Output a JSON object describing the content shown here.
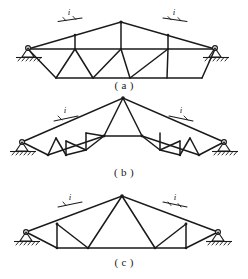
{
  "figure": {
    "kind": "engineering-line-drawing",
    "background_color": "#ffffff",
    "line_color": "#1a1a1a",
    "width": 248,
    "height": 279
  },
  "panels": [
    {
      "id": "a",
      "caption": "( a )",
      "truss_type": "trapezoidal-polonceau-with-flat-bottom-chord",
      "slope_labels": [
        "i",
        "i"
      ],
      "support_left": "pin-support",
      "support_right": "roller-support",
      "geometry": {
        "span_px": 200,
        "left_bearing": [
          28,
          49
        ],
        "right_bearing": [
          215,
          49
        ],
        "apex": [
          121,
          22
        ],
        "top_chord_nodes": [
          [
            28,
            49
          ],
          [
            75,
            35
          ],
          [
            121,
            22
          ],
          [
            168,
            35
          ],
          [
            215,
            49
          ]
        ],
        "mid_chord_nodes": [
          [
            28,
            49
          ],
          [
            75,
            49
          ],
          [
            121,
            49
          ],
          [
            168,
            49
          ],
          [
            215,
            49
          ]
        ],
        "bottom_chord_nodes": [
          [
            56,
            78
          ],
          [
            202,
            78
          ]
        ],
        "bottom_chord_interior": [
          [
            56,
            78
          ],
          [
            93,
            78
          ],
          [
            130,
            78
          ],
          [
            167,
            78
          ],
          [
            202,
            78
          ]
        ],
        "verticals": [
          [
            75,
            35,
            75,
            49
          ],
          [
            121,
            22,
            121,
            49
          ],
          [
            168,
            35,
            168,
            49
          ]
        ],
        "diagonals": [
          [
            28,
            49,
            56,
            78
          ],
          [
            56,
            78,
            75,
            49
          ],
          [
            75,
            49,
            93,
            78
          ],
          [
            93,
            78,
            121,
            49
          ],
          [
            121,
            49,
            130,
            78
          ],
          [
            130,
            78,
            168,
            49
          ],
          [
            168,
            49,
            167,
            78
          ],
          [
            167,
            78,
            202,
            78
          ],
          [
            202,
            78,
            215,
            49
          ]
        ]
      }
    },
    {
      "id": "b",
      "caption": "( b )",
      "truss_type": "steep-pitched-parallel-chord-gable-truss",
      "slope_labels": [
        "i",
        "i"
      ],
      "support_left": "pin-support",
      "support_right": "roller-support",
      "geometry": {
        "span_px": 200,
        "left_bearing": [
          22,
          142
        ],
        "right_bearing": [
          224,
          142
        ],
        "apex": [
          123,
          98
        ],
        "top_chord_nodes": [
          [
            22,
            142
          ],
          [
            123,
            98
          ],
          [
            224,
            142
          ]
        ],
        "bottom_chord_nodes": [
          [
            48,
            155
          ],
          [
            199,
            155
          ]
        ],
        "ridge_box": [
          [
            104,
            136
          ],
          [
            142,
            136
          ]
        ]
      }
    },
    {
      "id": "c",
      "caption": "( c )",
      "truss_type": "triangular-fink-truss-with-flat-bottom-chord",
      "slope_labels": [
        "i",
        "i"
      ],
      "support_left": "pin-support",
      "support_right": "roller-support",
      "geometry": {
        "span_px": 194,
        "left_bearing": [
          26,
          232
        ],
        "right_bearing": [
          218,
          232
        ],
        "apex": [
          122,
          196
        ],
        "bottom_chord_nodes": [
          [
            57,
            248
          ],
          [
            186,
            248
          ]
        ]
      }
    }
  ],
  "annotations": {
    "slope_symbol": "i",
    "slope_symbol_meaning": "roof-slope-ratio-marker"
  }
}
